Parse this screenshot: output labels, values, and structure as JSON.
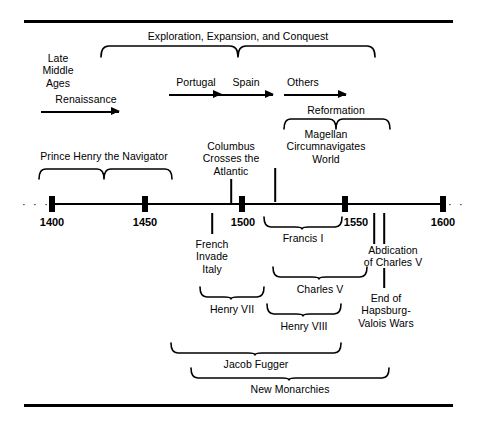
{
  "figure": {
    "axis": {
      "tick_labels": [
        "1400",
        "1450",
        "1500",
        "1550",
        "1600"
      ],
      "range_start": 1400,
      "range_end": 1600,
      "left_continuation": "· · · ·",
      "right_continuation": "· ·"
    },
    "above": {
      "late_middle_ages": "Late\nMiddle\nAges",
      "renaissance": "Renaissance",
      "exploration": "Exploration, Expansion, and Conquest",
      "portugal": "Portugal",
      "spain": "Spain",
      "others": "Others",
      "reformation": "Reformation",
      "prince_henry": "Prince Henry the Navigator",
      "columbus": "Columbus\nCrosses the\nAtlantic",
      "magellan": "Magellan\nCircumnavigates\nWorld"
    },
    "below": {
      "french_invade_italy": "French\nInvade\nItaly",
      "francis_i": "Francis I",
      "abdication": "Abdication\nof Charles V",
      "charles_v": "Charles V",
      "end_of_wars": "End of\nHapsburg-\nValois Wars",
      "henry_vii": "Henry VII",
      "henry_viii": "Henry VIII",
      "jacob_fugger": "Jacob Fugger",
      "new_monarchies": "New Monarchies"
    },
    "colors": {
      "ink": "#000000",
      "background": "#ffffff"
    }
  }
}
